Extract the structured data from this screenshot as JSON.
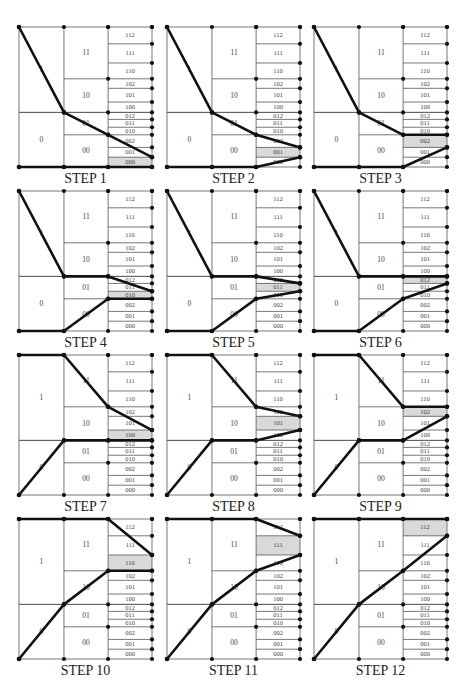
{
  "figure": {
    "layout": {
      "cols": 3,
      "rows": 4,
      "panel_x": [
        19,
        167,
        314
      ],
      "panel_y": [
        27,
        191,
        355,
        519
      ],
      "panel_w": 133,
      "panel_h": 140,
      "label_offset": 12
    },
    "columns_x_frac": [
      0,
      0.338,
      0.67,
      1.0
    ],
    "level1": [
      {
        "label": "1",
        "y0": 0,
        "y1": 0.61
      },
      {
        "label": "0",
        "y0": 0.61,
        "y1": 1.0
      }
    ],
    "level2": [
      {
        "label": "11",
        "y0": 0,
        "y1": 0.37
      },
      {
        "label": "10",
        "y0": 0.37,
        "y1": 0.61
      },
      {
        "label": "01",
        "y0": 0.61,
        "y1": 0.77
      },
      {
        "label": "00",
        "y0": 0.77,
        "y1": 1.0
      }
    ],
    "level3": [
      {
        "label": "112",
        "y0": 0,
        "y1": 0.12
      },
      {
        "label": "111",
        "y0": 0.12,
        "y1": 0.257
      },
      {
        "label": "110",
        "y0": 0.257,
        "y1": 0.37
      },
      {
        "label": "102",
        "y0": 0.37,
        "y1": 0.438
      },
      {
        "label": "101",
        "y0": 0.438,
        "y1": 0.536
      },
      {
        "label": "100",
        "y0": 0.536,
        "y1": 0.61
      },
      {
        "label": "012",
        "y0": 0.61,
        "y1": 0.66
      },
      {
        "label": "011",
        "y0": 0.66,
        "y1": 0.716
      },
      {
        "label": "010",
        "y0": 0.716,
        "y1": 0.77
      },
      {
        "label": "002",
        "y0": 0.77,
        "y1": 0.86
      },
      {
        "label": "001",
        "y0": 0.86,
        "y1": 0.93
      },
      {
        "label": "000",
        "y0": 0.93,
        "y1": 1.0
      }
    ],
    "steps": [
      {
        "label": "STEP 1",
        "highlight": "000",
        "upper": [
          [
            0,
            0
          ],
          [
            1,
            0.61
          ],
          [
            2,
            0.77
          ],
          [
            3,
            0.93
          ]
        ],
        "lower": [
          [
            0,
            1
          ],
          [
            1,
            1
          ],
          [
            2,
            1
          ],
          [
            3,
            1
          ]
        ]
      },
      {
        "label": "STEP 2",
        "highlight": "001",
        "upper": [
          [
            0,
            0
          ],
          [
            1,
            0.61
          ],
          [
            2,
            0.77
          ],
          [
            3,
            0.86
          ]
        ],
        "lower": [
          [
            0,
            1
          ],
          [
            1,
            1
          ],
          [
            2,
            1
          ],
          [
            3,
            0.93
          ]
        ]
      },
      {
        "label": "STEP 3",
        "highlight": "002",
        "upper": [
          [
            0,
            0
          ],
          [
            1,
            0.61
          ],
          [
            2,
            0.77
          ],
          [
            3,
            0.77
          ]
        ],
        "lower": [
          [
            0,
            1
          ],
          [
            1,
            1
          ],
          [
            2,
            1
          ],
          [
            3,
            0.86
          ]
        ]
      },
      {
        "label": "STEP 4",
        "highlight": "010",
        "upper": [
          [
            0,
            0
          ],
          [
            1,
            0.61
          ],
          [
            2,
            0.61
          ],
          [
            3,
            0.716
          ]
        ],
        "lower": [
          [
            0,
            1
          ],
          [
            1,
            1
          ],
          [
            2,
            0.77
          ],
          [
            3,
            0.77
          ]
        ]
      },
      {
        "label": "STEP 5",
        "highlight": "011",
        "upper": [
          [
            0,
            0
          ],
          [
            1,
            0.61
          ],
          [
            2,
            0.61
          ],
          [
            3,
            0.66
          ]
        ],
        "lower": [
          [
            0,
            1
          ],
          [
            1,
            1
          ],
          [
            2,
            0.77
          ],
          [
            3,
            0.716
          ]
        ]
      },
      {
        "label": "STEP 6",
        "highlight": "012",
        "upper": [
          [
            0,
            0
          ],
          [
            1,
            0.61
          ],
          [
            2,
            0.61
          ],
          [
            3,
            0.61
          ]
        ],
        "lower": [
          [
            0,
            1
          ],
          [
            1,
            1
          ],
          [
            2,
            0.77
          ],
          [
            3,
            0.66
          ]
        ]
      },
      {
        "label": "STEP 7",
        "highlight": "100",
        "upper": [
          [
            0,
            0
          ],
          [
            1,
            0
          ],
          [
            2,
            0.37
          ],
          [
            3,
            0.536
          ]
        ],
        "lower": [
          [
            0,
            1
          ],
          [
            1,
            0.61
          ],
          [
            2,
            0.61
          ],
          [
            3,
            0.61
          ]
        ]
      },
      {
        "label": "STEP 8",
        "highlight": "101",
        "upper": [
          [
            0,
            0
          ],
          [
            1,
            0
          ],
          [
            2,
            0.37
          ],
          [
            3,
            0.438
          ]
        ],
        "lower": [
          [
            0,
            1
          ],
          [
            1,
            0.61
          ],
          [
            2,
            0.61
          ],
          [
            3,
            0.536
          ]
        ]
      },
      {
        "label": "STEP 9",
        "highlight": "102",
        "upper": [
          [
            0,
            0
          ],
          [
            1,
            0
          ],
          [
            2,
            0.37
          ],
          [
            3,
            0.37
          ]
        ],
        "lower": [
          [
            0,
            1
          ],
          [
            1,
            0.61
          ],
          [
            2,
            0.61
          ],
          [
            3,
            0.438
          ]
        ]
      },
      {
        "label": "STEP 10",
        "highlight": "110",
        "upper": [
          [
            0,
            0
          ],
          [
            1,
            0
          ],
          [
            2,
            0
          ],
          [
            3,
            0.257
          ]
        ],
        "lower": [
          [
            0,
            1
          ],
          [
            1,
            0.61
          ],
          [
            2,
            0.37
          ],
          [
            3,
            0.37
          ]
        ]
      },
      {
        "label": "STEP 11",
        "highlight": "111",
        "upper": [
          [
            0,
            0
          ],
          [
            1,
            0
          ],
          [
            2,
            0
          ],
          [
            3,
            0.12
          ]
        ],
        "lower": [
          [
            0,
            1
          ],
          [
            1,
            0.61
          ],
          [
            2,
            0.37
          ],
          [
            3,
            0.257
          ]
        ]
      },
      {
        "label": "STEP 12",
        "highlight": "112",
        "upper": [
          [
            0,
            0
          ],
          [
            1,
            0
          ],
          [
            2,
            0
          ],
          [
            3,
            0
          ]
        ],
        "lower": [
          [
            0,
            1
          ],
          [
            1,
            0.61
          ],
          [
            2,
            0.37
          ],
          [
            3,
            0.12
          ]
        ]
      }
    ],
    "colors": {
      "highlight": "#d9d9d9",
      "grid": "#555555",
      "path": "#111111",
      "text": "#444444"
    }
  }
}
